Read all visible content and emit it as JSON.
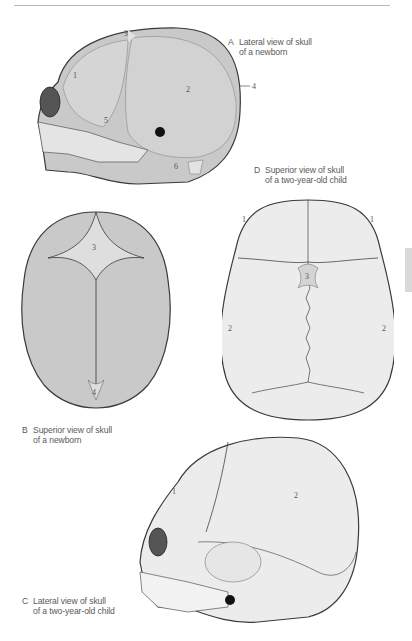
{
  "page": {
    "side_tab_color": "#d9d9d9",
    "rule_color": "#b8b8b8"
  },
  "figures": [
    {
      "id": "A",
      "letter": "A",
      "caption_line1": "Lateral view of skull",
      "caption_line2": "of a newborn",
      "labels": [
        "1",
        "2",
        "3",
        "4",
        "5",
        "6"
      ]
    },
    {
      "id": "B",
      "letter": "B",
      "caption_line1": "Superior view of skull",
      "caption_line2": "of a newborn",
      "labels": [
        "3",
        "4"
      ]
    },
    {
      "id": "C",
      "letter": "C",
      "caption_line1": "Lateral view of skull",
      "caption_line2": "of a two-year-old child",
      "labels": [
        "1",
        "2"
      ]
    },
    {
      "id": "D",
      "letter": "D",
      "caption_line1": "Superior view of skull",
      "caption_line2": "of a two-year-old child",
      "labels": [
        "1",
        "1",
        "2",
        "2",
        "3"
      ]
    }
  ],
  "colors": {
    "newborn_bone": "#c9c9c9",
    "newborn_fontanelle": "#dedede",
    "child_bone": "#ececec",
    "outline": "#3a3a3a"
  }
}
